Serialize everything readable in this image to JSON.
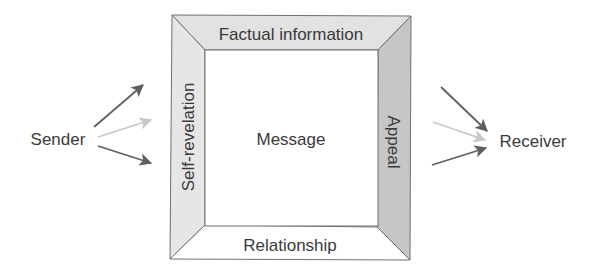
{
  "diagram": {
    "type": "four-sides-communication-model",
    "sender": {
      "label": "Sender"
    },
    "receiver": {
      "label": "Receiver"
    },
    "message": {
      "center_label": "Message",
      "sides": {
        "top": {
          "label": "Factual information",
          "fill": "#e2e2e2"
        },
        "left": {
          "label": "Self-revelation",
          "fill": "#e6e6e6"
        },
        "right": {
          "label": "Appeal",
          "fill": "#c6c6c6"
        },
        "bottom": {
          "label": "Relationship",
          "fill": "#ffffff"
        }
      },
      "inner_fill": "#ffffff",
      "stroke": "#6f6f6f"
    },
    "arrows": {
      "dark_color": "#5f5f5f",
      "light_color": "#c8c8c8",
      "sender_side": [
        {
          "shade": "dark"
        },
        {
          "shade": "light"
        },
        {
          "shade": "dark"
        }
      ],
      "receiver_side": [
        {
          "shade": "dark"
        },
        {
          "shade": "light"
        },
        {
          "shade": "dark"
        }
      ]
    }
  }
}
